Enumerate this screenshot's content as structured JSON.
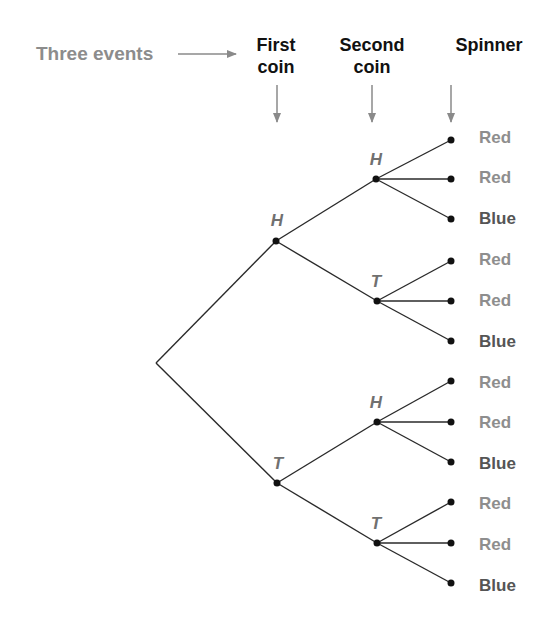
{
  "title_label": "Three events",
  "headers": [
    {
      "line1": "First",
      "line2": "coin"
    },
    {
      "line1": "Second",
      "line2": "coin"
    },
    {
      "line1": "Spinner",
      "line2": ""
    }
  ],
  "first_coin": [
    {
      "label": "H"
    },
    {
      "label": "T"
    }
  ],
  "second_coin": [
    {
      "label": "H"
    },
    {
      "label": "T"
    },
    {
      "label": "H"
    },
    {
      "label": "T"
    }
  ],
  "outcomes": [
    {
      "label": "Red",
      "color": "red"
    },
    {
      "label": "Red",
      "color": "red"
    },
    {
      "label": "Blue",
      "color": "blue"
    },
    {
      "label": "Red",
      "color": "red"
    },
    {
      "label": "Red",
      "color": "red"
    },
    {
      "label": "Blue",
      "color": "blue"
    },
    {
      "label": "Red",
      "color": "red"
    },
    {
      "label": "Red",
      "color": "red"
    },
    {
      "label": "Blue",
      "color": "blue"
    },
    {
      "label": "Red",
      "color": "red"
    },
    {
      "label": "Red",
      "color": "red"
    },
    {
      "label": "Blue",
      "color": "blue"
    }
  ],
  "colors": {
    "line": "#2a2a2a",
    "arrow": "#8a8a8a",
    "events_text": "#8c8c8c",
    "red_outcome_text": "#8e8e8e",
    "blue_outcome_text": "#555555",
    "node_label": "#707070"
  }
}
